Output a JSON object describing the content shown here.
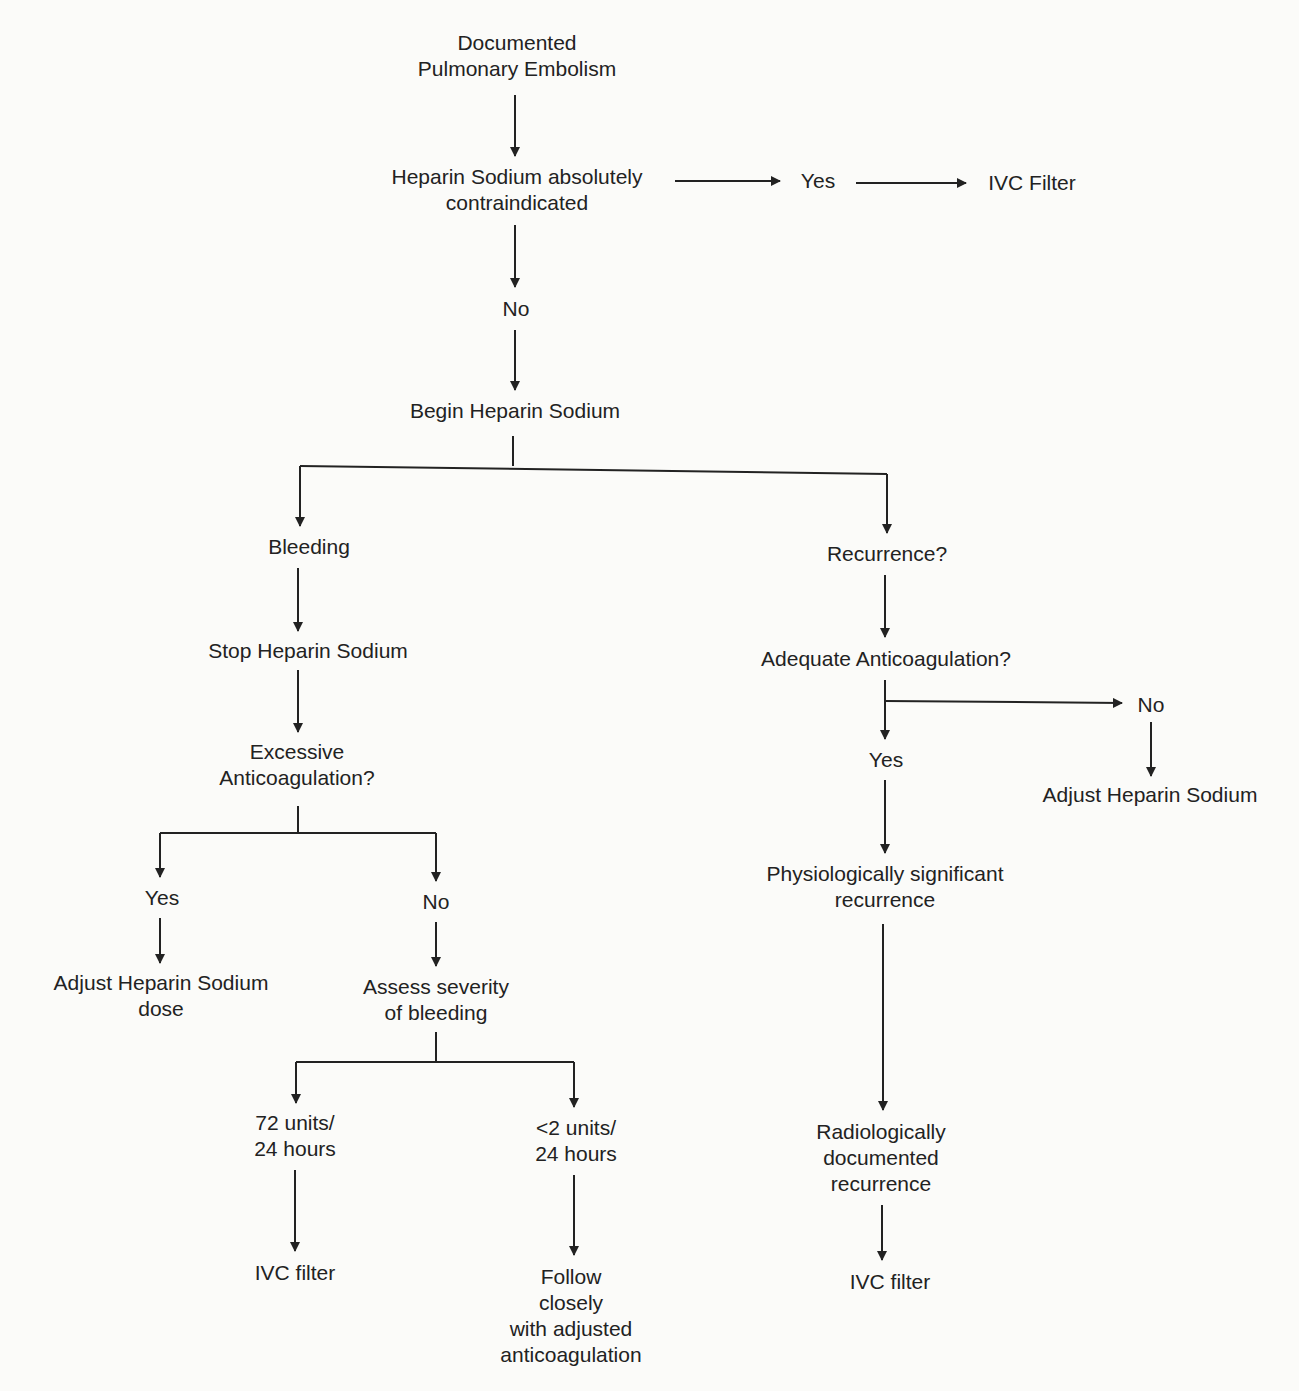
{
  "diagram": {
    "nodes": {
      "start": {
        "lines": [
          "Documented",
          "Pulmonary Embolism"
        ]
      },
      "contraindicated": {
        "lines": [
          "Heparin Sodium absolutely",
          "contraindicated"
        ]
      },
      "top_yes": {
        "lines": [
          "Yes"
        ]
      },
      "top_ivc": {
        "lines": [
          "IVC Filter"
        ]
      },
      "top_no": {
        "lines": [
          "No"
        ]
      },
      "begin": {
        "lines": [
          "Begin Heparin Sodium"
        ]
      },
      "bleeding": {
        "lines": [
          "Bleeding"
        ]
      },
      "stop": {
        "lines": [
          "Stop Heparin Sodium"
        ]
      },
      "excessive": {
        "lines": [
          "Excessive",
          "Anticoagulation?"
        ]
      },
      "exc_yes": {
        "lines": [
          "Yes"
        ]
      },
      "exc_no": {
        "lines": [
          "No"
        ]
      },
      "adjust_dose": {
        "lines": [
          "Adjust Heparin Sodium",
          "dose"
        ]
      },
      "assess": {
        "lines": [
          "Assess severity",
          "of bleeding"
        ]
      },
      "units72": {
        "lines": [
          "72 units/",
          "24 hours"
        ]
      },
      "units2": {
        "lines": [
          "<2 units/",
          "24 hours"
        ]
      },
      "ivc_left": {
        "lines": [
          "IVC filter"
        ]
      },
      "follow": {
        "lines": [
          "Follow",
          "closely",
          "with adjusted",
          "anticoagulation"
        ]
      },
      "recurrence": {
        "lines": [
          "Recurrence?"
        ]
      },
      "adequate": {
        "lines": [
          "Adequate Anticoagulation?"
        ]
      },
      "adeq_yes": {
        "lines": [
          "Yes"
        ]
      },
      "adeq_no": {
        "lines": [
          "No"
        ]
      },
      "adjust_heparin": {
        "lines": [
          "Adjust Heparin Sodium"
        ]
      },
      "physio": {
        "lines": [
          "Physiologically significant",
          "recurrence"
        ]
      },
      "radio": {
        "lines": [
          "Radiologically",
          "documented",
          "recurrence"
        ]
      },
      "ivc_right": {
        "lines": [
          "IVC filter"
        ]
      }
    }
  }
}
